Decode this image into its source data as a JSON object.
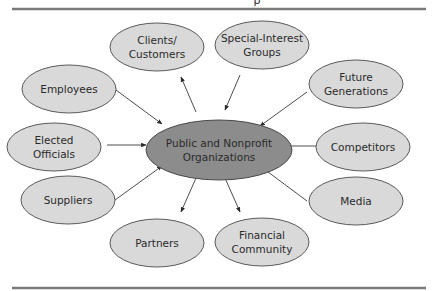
{
  "diagram": {
    "header_fragment": "p",
    "center": {
      "id": "center",
      "lines": [
        "Public and Nonprofit",
        "Organizations"
      ]
    },
    "nodes": [
      {
        "id": "clients",
        "lines": [
          "Clients/",
          "Customers"
        ],
        "direction": "outgoing"
      },
      {
        "id": "special-interest",
        "lines": [
          "Special-Interest",
          "Groups"
        ],
        "direction": "incoming"
      },
      {
        "id": "employees",
        "lines": [
          "Employees"
        ],
        "direction": "incoming"
      },
      {
        "id": "future-generations",
        "lines": [
          "Future",
          "Generations"
        ],
        "direction": "incoming"
      },
      {
        "id": "elected-officials",
        "lines": [
          "Elected",
          "Officials"
        ],
        "direction": "incoming"
      },
      {
        "id": "competitors",
        "lines": [
          "Competitors"
        ],
        "direction": "incoming"
      },
      {
        "id": "suppliers",
        "lines": [
          "Suppliers"
        ],
        "direction": "incoming"
      },
      {
        "id": "media",
        "lines": [
          "Media"
        ],
        "direction": "incoming"
      },
      {
        "id": "partners",
        "lines": [
          "Partners"
        ],
        "direction": "outgoing"
      },
      {
        "id": "financial-community",
        "lines": [
          "Financial",
          "Community"
        ],
        "direction": "outgoing"
      }
    ]
  }
}
